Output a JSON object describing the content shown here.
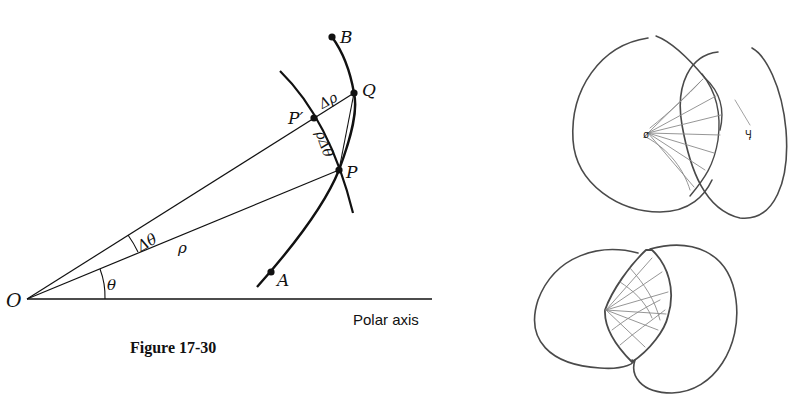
{
  "figure": {
    "caption": "Figure 17-30",
    "axis_label": "Polar axis",
    "points": {
      "O": "O",
      "A": "A",
      "B": "B",
      "P": "P",
      "P_prime": "P′",
      "Q": "Q"
    },
    "annotations": {
      "theta": "θ",
      "delta_theta": "Δθ",
      "rho": "ρ",
      "delta_rho": "Δρ",
      "rho_delta_theta": "ρΔθ"
    }
  },
  "sketches": {
    "top": {
      "description": "hand-drawn overlapping lobes with radial lines",
      "mark_left": "ø",
      "mark_right": "Ӌ"
    },
    "bottom": {
      "description": "hand-drawn overlapping lobes with shaded lens region"
    }
  },
  "colors": {
    "ink": "#111111",
    "pencil": "#4a4a4a",
    "pencil_light": "#8a8a8a",
    "background": "#ffffff"
  }
}
